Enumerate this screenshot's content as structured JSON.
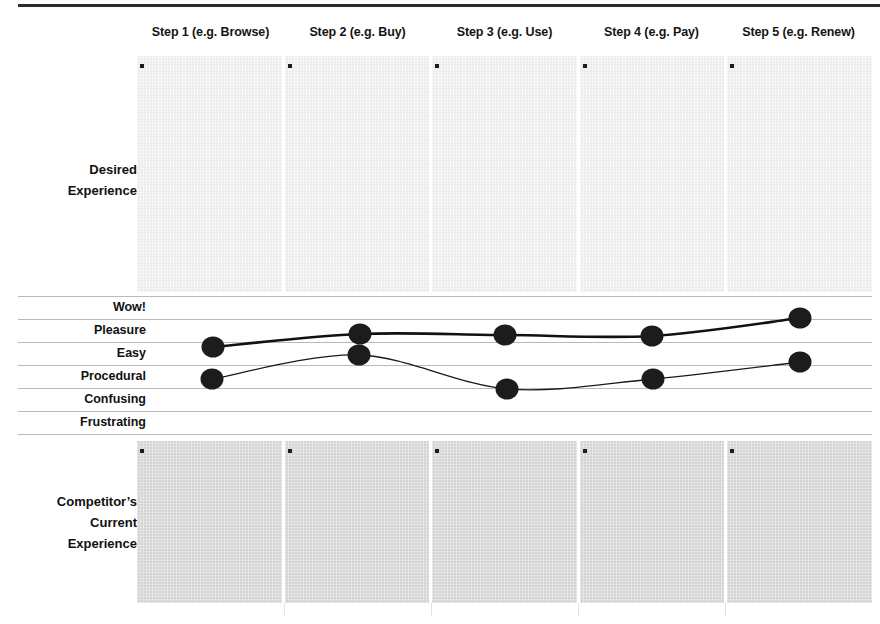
{
  "header": {
    "steps": [
      "Step 1 (e.g. Browse)",
      "Step 2 (e.g. Buy)",
      "Step 3 (e.g. Use)",
      "Step 4 (e.g. Pay)",
      "Step 5 (e.g. Renew)"
    ]
  },
  "captions": {
    "desired_line1": "Desired",
    "desired_line2": "Experience",
    "competitor_line1": "Competitor’s",
    "competitor_line2": "Current",
    "competitor_line3": "Experience"
  },
  "scale": {
    "levels": [
      "Wow!",
      "Pleasure",
      "Easy",
      "Procedural",
      "Confusing",
      "Frustrating"
    ]
  },
  "colors": {
    "rule_dark": "#2b2b2b",
    "grid_line": "#b9b9b9",
    "panel_top_fill": "#ebebeb",
    "panel_bottom_fill": "#d4d4d4",
    "marker": "#1d1d1d",
    "dot": "#1c1c1c",
    "curve_desired": "#111111",
    "curve_competitor": "#1a1a1a"
  },
  "chart_data": {
    "type": "line",
    "title": "",
    "xlabel": "",
    "ylabel": "",
    "grid": true,
    "legend": "none",
    "categories": [
      "Step 1 (e.g. Browse)",
      "Step 2 (e.g. Buy)",
      "Step 3 (e.g. Use)",
      "Step 4 (e.g. Pay)",
      "Step 5 (e.g. Renew)"
    ],
    "y_levels": [
      "Wow!",
      "Pleasure",
      "Easy",
      "Procedural",
      "Confusing",
      "Frustrating"
    ],
    "ylim": [
      "Wow!",
      "Frustrating"
    ],
    "series": [
      {
        "name": "Desired Experience",
        "style": "thick",
        "values": [
          "Pleasure/Easy",
          "Pleasure",
          "Pleasure",
          "Pleasure",
          "Wow!/Pleasure"
        ],
        "points_px": [
          {
            "x": 213,
            "y": 347
          },
          {
            "x": 360,
            "y": 334
          },
          {
            "x": 505,
            "y": 335
          },
          {
            "x": 652,
            "y": 336
          },
          {
            "x": 800,
            "y": 318
          }
        ]
      },
      {
        "name": "Competitor's Current Experience",
        "style": "thin",
        "values": [
          "Procedural",
          "Easy",
          "Procedural/Confusing",
          "Procedural",
          "Easy"
        ],
        "points_px": [
          {
            "x": 212,
            "y": 379
          },
          {
            "x": 359,
            "y": 355
          },
          {
            "x": 507,
            "y": 389
          },
          {
            "x": 653,
            "y": 379
          },
          {
            "x": 800,
            "y": 362
          }
        ]
      }
    ]
  }
}
